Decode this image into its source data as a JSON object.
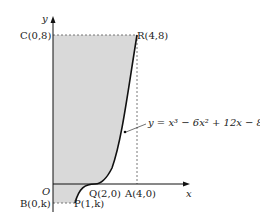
{
  "diagram": {
    "axes": {
      "x_label": "x",
      "y_label": "y",
      "origin_label": "O"
    },
    "curve": {
      "equation": "y = x³ − 6x² + 12x − 8",
      "x_range": [
        1,
        4
      ]
    },
    "points": {
      "C": "C(0,8)",
      "R": "R(4,8)",
      "Q": "Q(2,0)",
      "A": "A(4,0)",
      "B": "B(0,k)",
      "P": "P(1,k)"
    },
    "shaded_region": "region bounded by curve, y-axis, y=8 and y=k",
    "colors": {
      "shade": "#d9d9d9",
      "line": "#111111",
      "dash": "#555555"
    }
  }
}
